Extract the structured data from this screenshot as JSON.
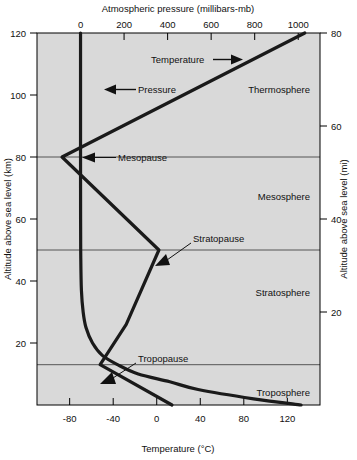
{
  "figure": {
    "background": "#ffffff",
    "plot_background": "#d9d9d9",
    "axis_color": "#000000",
    "curve_color": "#111111",
    "divider_color": "#555555"
  },
  "axes": {
    "top": {
      "title": "Atmospheric pressure (millibars-mb)",
      "ticks": [
        0,
        200,
        400,
        600,
        800,
        1000
      ],
      "range": [
        -200,
        1100
      ]
    },
    "bottom": {
      "title": "Temperature (°C)",
      "ticks": [
        -80,
        -40,
        0,
        40,
        80,
        120
      ],
      "range": [
        -110,
        150
      ]
    },
    "left": {
      "title": "Altitude above sea level (km)",
      "ticks": [
        20,
        40,
        60,
        80,
        100,
        120
      ],
      "range": [
        0,
        120
      ]
    },
    "right": {
      "title": "Altitude above sea level (mi)",
      "ticks": [
        20,
        40,
        60,
        80
      ],
      "range": [
        0,
        80
      ]
    }
  },
  "layers": [
    {
      "name": "Thermosphere",
      "label_y_km": 101
    },
    {
      "name": "Mesosphere",
      "label_y_km": 65
    },
    {
      "name": "Stratosphere",
      "label_y_km": 35
    },
    {
      "name": "Troposphere",
      "label_y_km": 7
    }
  ],
  "boundaries": [
    {
      "name": "Mesopause",
      "altitude_km": 80
    },
    {
      "name": "Stratopause",
      "altitude_km": 50
    },
    {
      "name": "Tropopause",
      "altitude_km": 13
    }
  ],
  "series_labels": {
    "temperature": "Temperature",
    "pressure": "Pressure"
  },
  "chart_data": {
    "type": "line",
    "title": "Atmospheric pressure (millibars-mb)",
    "xlabel": "Temperature (°C)",
    "ylabel": "Altitude above sea level (km)",
    "xlim": [
      -110,
      150
    ],
    "ylim": [
      0,
      120
    ],
    "top_axis": {
      "label": "Atmospheric pressure (millibars-mb)",
      "lim": [
        -200,
        1100
      ],
      "ticks": [
        0,
        200,
        400,
        600,
        800,
        1000
      ]
    },
    "right_axis": {
      "label": "Altitude above sea level (mi)",
      "lim": [
        0,
        80
      ],
      "ticks": [
        20,
        40,
        60,
        80
      ]
    },
    "grid": false,
    "legend": "inline-annotations",
    "series": [
      {
        "name": "Temperature",
        "units": "°C",
        "x_axis": "bottom",
        "points": [
          {
            "temperature_c": 14,
            "altitude_km": 0
          },
          {
            "temperature_c": -52,
            "altitude_km": 13
          },
          {
            "temperature_c": -28,
            "altitude_km": 26
          },
          {
            "temperature_c": 2,
            "altitude_km": 50
          },
          {
            "temperature_c": -87,
            "altitude_km": 80
          },
          {
            "temperature_c": 136,
            "altitude_km": 120
          }
        ]
      },
      {
        "name": "Pressure",
        "units": "mb",
        "x_axis": "top",
        "points": [
          {
            "pressure_mb": 1013,
            "altitude_km": 0
          },
          {
            "pressure_mb": 795,
            "altitude_km": 2
          },
          {
            "pressure_mb": 540,
            "altitude_km": 5
          },
          {
            "pressure_mb": 410,
            "altitude_km": 7.5
          },
          {
            "pressure_mb": 265,
            "altitude_km": 10
          },
          {
            "pressure_mb": 170,
            "altitude_km": 13
          },
          {
            "pressure_mb": 100,
            "altitude_km": 16
          },
          {
            "pressure_mb": 55,
            "altitude_km": 20
          },
          {
            "pressure_mb": 25,
            "altitude_km": 25
          },
          {
            "pressure_mb": 12,
            "altitude_km": 30
          },
          {
            "pressure_mb": 4,
            "altitude_km": 37
          },
          {
            "pressure_mb": 1,
            "altitude_km": 48
          },
          {
            "pressure_mb": 0.3,
            "altitude_km": 60
          },
          {
            "pressure_mb": 0.05,
            "altitude_km": 75
          },
          {
            "pressure_mb": 0.01,
            "altitude_km": 90
          },
          {
            "pressure_mb": 0,
            "altitude_km": 120
          }
        ]
      }
    ],
    "annotations": [
      {
        "text": "Temperature",
        "kind": "series-arrow"
      },
      {
        "text": "Pressure",
        "kind": "series-arrow"
      },
      {
        "text": "Mesopause",
        "kind": "boundary-arrow",
        "altitude_km": 80
      },
      {
        "text": "Stratopause",
        "kind": "boundary-arrow",
        "altitude_km": 50
      },
      {
        "text": "Tropopause",
        "kind": "boundary-arrow",
        "altitude_km": 13
      },
      {
        "text": "Thermosphere",
        "kind": "layer"
      },
      {
        "text": "Mesosphere",
        "kind": "layer"
      },
      {
        "text": "Stratosphere",
        "kind": "layer"
      },
      {
        "text": "Troposphere",
        "kind": "layer"
      }
    ]
  }
}
